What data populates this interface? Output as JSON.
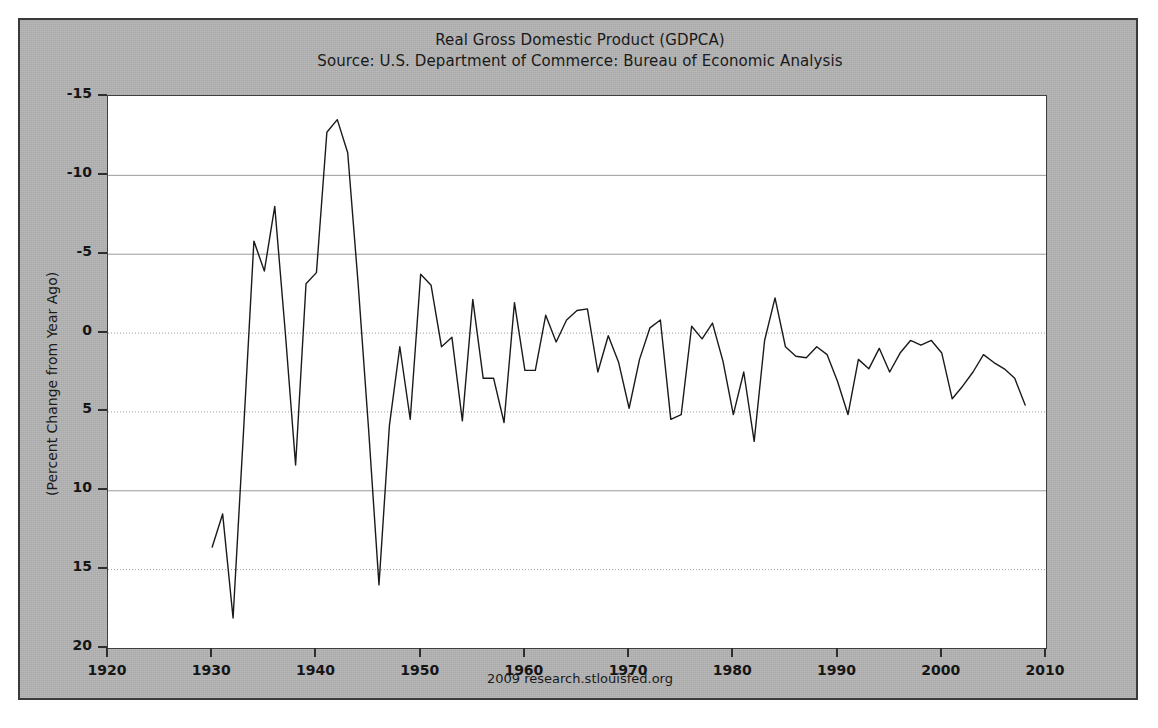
{
  "chart": {
    "title": "Real Gross Domestic Product (GDPCA)",
    "subtitle": "Source: U.S. Department of Commerce: Bureau of Economic Analysis",
    "footer": "2009 research.stlouisfed.org",
    "ylabel": "(Percent Change from Year Ago)",
    "panel_color": "#b2b2b2",
    "plot_background": "#ffffff",
    "line_color": "#1a1a1a",
    "grid_color": "#9a9a9a",
    "border_color": "#3a3a3a"
  },
  "chart_data": {
    "type": "line",
    "title": "Real Gross Domestic Product (GDPCA)",
    "subtitle": "Source: U.S. Department of Commerce: Bureau of Economic Analysis",
    "xlabel": "",
    "ylabel": "(Percent Change from Year Ago)",
    "xlim": [
      1920,
      2010
    ],
    "ylim": [
      -15,
      20
    ],
    "xticks": [
      1920,
      1930,
      1940,
      1950,
      1960,
      1970,
      1980,
      1990,
      2000,
      2010
    ],
    "yticks": [
      -15,
      -10,
      -5,
      0,
      5,
      10,
      15,
      20
    ],
    "grid": true,
    "legend": null,
    "series": [
      {
        "name": "Real GDP, Percent Change from Year Ago",
        "x": [
          1930,
          1931,
          1932,
          1933,
          1934,
          1935,
          1936,
          1937,
          1938,
          1939,
          1940,
          1941,
          1942,
          1943,
          1944,
          1945,
          1946,
          1947,
          1948,
          1949,
          1950,
          1951,
          1952,
          1953,
          1954,
          1955,
          1956,
          1957,
          1958,
          1959,
          1960,
          1961,
          1962,
          1963,
          1964,
          1965,
          1966,
          1967,
          1968,
          1969,
          1970,
          1971,
          1972,
          1973,
          1974,
          1975,
          1976,
          1977,
          1978,
          1979,
          1980,
          1981,
          1982,
          1983,
          1984,
          1985,
          1986,
          1987,
          1988,
          1989,
          1990,
          1991,
          1992,
          1993,
          1994,
          1995,
          1996,
          1997,
          1998,
          1999,
          2000,
          2001,
          2002,
          2003,
          2004,
          2005,
          2006,
          2007,
          2008
        ],
        "values": [
          -8.6,
          -6.5,
          -13.1,
          -1.3,
          10.8,
          8.9,
          13.0,
          5.1,
          -3.4,
          8.1,
          8.8,
          17.7,
          18.5,
          16.4,
          8.1,
          -1.1,
          -11.0,
          -0.9,
          4.1,
          -0.5,
          8.7,
          8.0,
          4.1,
          4.7,
          -0.6,
          7.1,
          2.1,
          2.1,
          -0.7,
          6.9,
          2.6,
          2.6,
          6.1,
          4.4,
          5.8,
          6.4,
          6.5,
          2.5,
          4.8,
          3.1,
          0.2,
          3.3,
          5.3,
          5.8,
          -0.5,
          -0.2,
          5.4,
          4.6,
          5.6,
          3.2,
          -0.2,
          2.5,
          -1.9,
          4.5,
          7.2,
          4.1,
          3.5,
          3.4,
          4.1,
          3.6,
          1.9,
          -0.2,
          3.3,
          2.7,
          4.0,
          2.5,
          3.7,
          4.5,
          4.2,
          4.5,
          3.7,
          0.8,
          1.6,
          2.5,
          3.6,
          3.1,
          2.7,
          2.1,
          0.4
        ]
      }
    ]
  },
  "ytick_labels": [
    "20",
    "15",
    "10",
    "5",
    "0",
    "-5",
    "-10",
    "-15"
  ],
  "xtick_labels": [
    "1920",
    "1930",
    "1940",
    "1950",
    "1960",
    "1970",
    "1980",
    "1990",
    "2000",
    "2010"
  ]
}
